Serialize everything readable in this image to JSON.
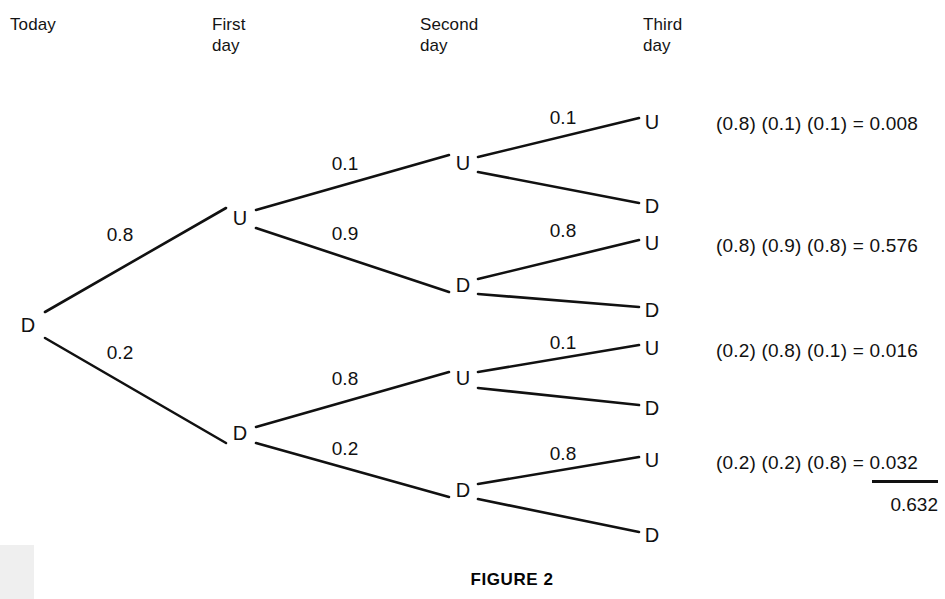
{
  "figure": {
    "caption": "FIGURE 2",
    "caption_x": 512,
    "caption_y": 570
  },
  "columns": [
    {
      "id": "today",
      "label": "Today",
      "x": 10,
      "y": 14
    },
    {
      "id": "first-day",
      "label": "First\nday",
      "x": 212,
      "y": 14
    },
    {
      "id": "second-day",
      "label": "Second\nday",
      "x": 420,
      "y": 14
    },
    {
      "id": "third-day",
      "label": "Third\nday",
      "x": 643,
      "y": 14
    }
  ],
  "nodes": [
    {
      "id": "root",
      "label": "D",
      "x": 28,
      "y": 325,
      "level": 0
    },
    {
      "id": "d1-u",
      "label": "U",
      "x": 240,
      "y": 218,
      "level": 1
    },
    {
      "id": "d1-d",
      "label": "D",
      "x": 240,
      "y": 433,
      "level": 1
    },
    {
      "id": "d2-uu",
      "label": "U",
      "x": 463,
      "y": 163,
      "level": 2
    },
    {
      "id": "d2-ud",
      "label": "D",
      "x": 463,
      "y": 285,
      "level": 2
    },
    {
      "id": "d2-du",
      "label": "U",
      "x": 463,
      "y": 378,
      "level": 2
    },
    {
      "id": "d2-dd",
      "label": "D",
      "x": 463,
      "y": 490,
      "level": 2
    },
    {
      "id": "d3-uuu",
      "label": "U",
      "x": 652,
      "y": 122,
      "level": 3
    },
    {
      "id": "d3-uud",
      "label": "D",
      "x": 652,
      "y": 206,
      "level": 3
    },
    {
      "id": "d3-udu",
      "label": "U",
      "x": 652,
      "y": 243,
      "level": 3
    },
    {
      "id": "d3-udd",
      "label": "D",
      "x": 652,
      "y": 310,
      "level": 3
    },
    {
      "id": "d3-duu",
      "label": "U",
      "x": 652,
      "y": 348,
      "level": 3
    },
    {
      "id": "d3-dud",
      "label": "D",
      "x": 652,
      "y": 408,
      "level": 3
    },
    {
      "id": "d3-ddu",
      "label": "U",
      "x": 652,
      "y": 460,
      "level": 3
    },
    {
      "id": "d3-ddd",
      "label": "D",
      "x": 652,
      "y": 535,
      "level": 3
    }
  ],
  "edges": [
    {
      "id": "root-to-d1u",
      "from": "root",
      "to": "d1-u",
      "x1": 45,
      "y1": 312,
      "x2": 226,
      "y2": 208,
      "probability": "0.8",
      "label_x": 120,
      "label_y": 234
    },
    {
      "id": "root-to-d1d",
      "from": "root",
      "to": "d1-d",
      "x1": 45,
      "y1": 338,
      "x2": 226,
      "y2": 443,
      "probability": "0.2",
      "label_x": 120,
      "label_y": 352
    },
    {
      "id": "d1u-to-d2uu",
      "from": "d1-u",
      "to": "d2-uu",
      "x1": 256,
      "y1": 210,
      "x2": 449,
      "y2": 155,
      "probability": "0.1",
      "label_x": 345,
      "label_y": 163
    },
    {
      "id": "d1u-to-d2ud",
      "from": "d1-u",
      "to": "d2-ud",
      "x1": 256,
      "y1": 228,
      "x2": 449,
      "y2": 292,
      "probability": "0.9",
      "label_x": 345,
      "label_y": 233
    },
    {
      "id": "d1d-to-d2du",
      "from": "d1-d",
      "to": "d2-du",
      "x1": 256,
      "y1": 427,
      "x2": 449,
      "y2": 372,
      "probability": "0.8",
      "label_x": 345,
      "label_y": 378
    },
    {
      "id": "d1d-to-d2dd",
      "from": "d1-d",
      "to": "d2-dd",
      "x1": 256,
      "y1": 443,
      "x2": 449,
      "y2": 497,
      "probability": "0.2",
      "label_x": 345,
      "label_y": 448
    },
    {
      "id": "d2uu-to-u",
      "from": "d2-uu",
      "to": "d3-uuu",
      "x1": 478,
      "y1": 157,
      "x2": 639,
      "y2": 118,
      "probability": "0.1",
      "label_x": 563,
      "label_y": 117
    },
    {
      "id": "d2uu-to-d",
      "from": "d2-uu",
      "to": "d3-uud",
      "x1": 478,
      "y1": 172,
      "x2": 639,
      "y2": 203,
      "probability": "",
      "label_x": 0,
      "label_y": 0
    },
    {
      "id": "d2ud-to-u",
      "from": "d2-ud",
      "to": "d3-udu",
      "x1": 478,
      "y1": 279,
      "x2": 639,
      "y2": 240,
      "probability": "0.8",
      "label_x": 563,
      "label_y": 230
    },
    {
      "id": "d2ud-to-d",
      "from": "d2-ud",
      "to": "d3-udd",
      "x1": 478,
      "y1": 294,
      "x2": 639,
      "y2": 307,
      "probability": "",
      "label_x": 0,
      "label_y": 0
    },
    {
      "id": "d2du-to-u",
      "from": "d2-du",
      "to": "d3-duu",
      "x1": 478,
      "y1": 372,
      "x2": 639,
      "y2": 345,
      "probability": "0.1",
      "label_x": 563,
      "label_y": 342
    },
    {
      "id": "d2du-to-d",
      "from": "d2-du",
      "to": "d3-dud",
      "x1": 478,
      "y1": 388,
      "x2": 639,
      "y2": 405,
      "probability": "",
      "label_x": 0,
      "label_y": 0
    },
    {
      "id": "d2dd-to-u",
      "from": "d2-dd",
      "to": "d3-ddu",
      "x1": 478,
      "y1": 484,
      "x2": 639,
      "y2": 457,
      "probability": "0.8",
      "label_x": 563,
      "label_y": 453
    },
    {
      "id": "d2dd-to-d",
      "from": "d2-dd",
      "to": "d3-ddd",
      "x1": 478,
      "y1": 499,
      "x2": 639,
      "y2": 532,
      "probability": "",
      "label_x": 0,
      "label_y": 0
    }
  ],
  "equations": [
    {
      "id": "eq-uuu",
      "expression": "(0.8) (0.1) (0.1) =",
      "result": "0.008",
      "x": 716,
      "y": 114,
      "underlined": false
    },
    {
      "id": "eq-udu",
      "expression": "(0.8) (0.9) (0.8) =",
      "result": "0.576",
      "x": 716,
      "y": 236,
      "underlined": false
    },
    {
      "id": "eq-duu",
      "expression": "(0.2) (0.8) (0.1) =",
      "result": "0.016",
      "x": 716,
      "y": 341,
      "underlined": false
    },
    {
      "id": "eq-ddu",
      "expression": "(0.2) (0.2) (0.8) =",
      "result": "0.032",
      "x": 716,
      "y": 453,
      "underlined": true
    }
  ],
  "sum": {
    "total": "0.632",
    "rule_x": 872,
    "rule_y": 480,
    "rule_width": 66,
    "total_x": 872,
    "total_y": 495
  },
  "chart_data": {
    "type": "tree",
    "title": "FIGURE 2",
    "root_state": "D",
    "stage_labels": [
      "Today",
      "First day",
      "Second day",
      "Third day"
    ],
    "outcome_states": [
      "U",
      "D"
    ],
    "transition_probabilities": {
      "from_D_to_U": 0.8,
      "from_D_to_D": 0.2,
      "from_U_to_U": 0.1,
      "from_U_to_D": 0.9
    },
    "branches": [
      {
        "path": [
          "D",
          "U",
          "U",
          "U"
        ],
        "probabilities": [
          0.8,
          0.1,
          0.1
        ],
        "product": 0.008,
        "shown": true
      },
      {
        "path": [
          "D",
          "U",
          "U",
          "D"
        ],
        "probabilities": [
          0.8,
          0.1,
          0.9
        ],
        "product": null,
        "shown": false
      },
      {
        "path": [
          "D",
          "U",
          "D",
          "U"
        ],
        "probabilities": [
          0.8,
          0.9,
          0.8
        ],
        "product": 0.576,
        "shown": true
      },
      {
        "path": [
          "D",
          "U",
          "D",
          "D"
        ],
        "probabilities": [
          0.8,
          0.9,
          0.2
        ],
        "product": null,
        "shown": false
      },
      {
        "path": [
          "D",
          "D",
          "U",
          "U"
        ],
        "probabilities": [
          0.2,
          0.8,
          0.1
        ],
        "product": 0.016,
        "shown": true
      },
      {
        "path": [
          "D",
          "D",
          "U",
          "D"
        ],
        "probabilities": [
          0.2,
          0.8,
          0.9
        ],
        "product": null,
        "shown": false
      },
      {
        "path": [
          "D",
          "D",
          "D",
          "U"
        ],
        "probabilities": [
          0.2,
          0.2,
          0.8
        ],
        "product": 0.032,
        "shown": true
      },
      {
        "path": [
          "D",
          "D",
          "D",
          "D"
        ],
        "probabilities": [
          0.2,
          0.2,
          0.2
        ],
        "product": null,
        "shown": false
      }
    ],
    "sum_of_shown_products": 0.632,
    "line_color": "#111111",
    "background": "#ffffff"
  }
}
